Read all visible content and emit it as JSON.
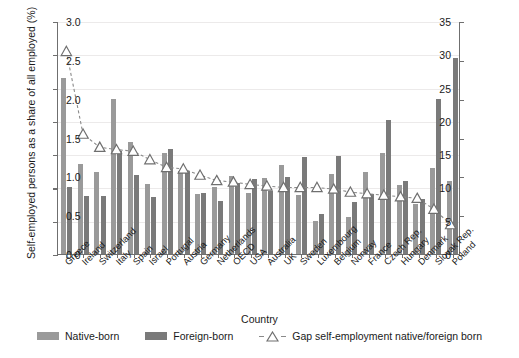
{
  "chart_data": {
    "type": "bar",
    "title": "",
    "xlabel": "Country",
    "ylabel": "Self-employed persons as a share of all employed (%)",
    "ylabel_right": "Gap self-employment native/foreign born (%)",
    "ylim": [
      0,
      35
    ],
    "ylim_right": [
      0,
      3.0
    ],
    "yticks": [
      "0",
      "5",
      "10",
      "15",
      "20",
      "25",
      "30",
      "35"
    ],
    "yticks_right": [
      "0.0",
      "0.5",
      "1.0",
      "1.5",
      "2.0",
      "2.5",
      "3.0"
    ],
    "grid": true,
    "legend_position": "bottom",
    "categories": [
      "Greece",
      "Ireland",
      "Switzerland",
      "Italy",
      "Spain",
      "Israel",
      "Portugal",
      "Austria",
      "Germany",
      "Netherlands",
      "OECD",
      "USA",
      "Australia",
      "UK",
      "Sweden",
      "Luxembourg",
      "Belgium",
      "Norway",
      "France",
      "Czech Rep.",
      "Hungary",
      "Denmark",
      "Slovak Rep.",
      "Poland"
    ],
    "series": [
      {
        "name": "Native-born",
        "color": "#9a9a9a",
        "values": [
          26.5,
          13.5,
          12.3,
          23.3,
          16.8,
          10.5,
          15.1,
          12.5,
          9.0,
          10.0,
          11.7,
          9.2,
          11.4,
          13.4,
          8.8,
          5.0,
          12.0,
          5.5,
          12.3,
          15.2,
          10.3,
          7.5,
          12.9,
          11.0
        ]
      },
      {
        "name": "Foreign-born",
        "color": "#7a7a7a",
        "values": [
          10.1,
          8.7,
          8.7,
          15.5,
          11.9,
          8.5,
          15.8,
          12.5,
          9.1,
          8.0,
          10.6,
          11.2,
          9.5,
          11.6,
          14.5,
          6.0,
          14.7,
          7.8,
          9.0,
          20.2,
          11.0,
          8.3,
          23.3,
          29.5
        ]
      }
    ],
    "gap_series": {
      "name": "Gap self-employment native/foreign born",
      "axis": "right",
      "marker": "triangle-up",
      "linestyle": "dashed",
      "color": "#8a8a8a",
      "values": [
        2.62,
        1.55,
        1.38,
        1.35,
        1.33,
        1.22,
        1.12,
        1.1,
        1.02,
        0.95,
        0.93,
        0.9,
        0.88,
        0.86,
        0.86,
        0.86,
        0.84,
        0.8,
        0.78,
        0.76,
        0.74,
        0.72,
        0.58,
        0.38
      ]
    }
  },
  "legend": {
    "native_label": "Native-born",
    "foreign_label": "Foreign-born",
    "gap_label": "Gap self-employment native/foreign born"
  }
}
